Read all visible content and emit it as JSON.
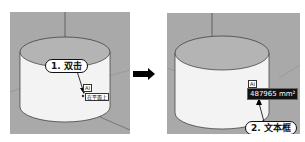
{
  "left_panel": {
    "callout": "1. 双击",
    "tag_top": "AI",
    "tag_bottom": "在平面上"
  },
  "right_panel": {
    "callout": "2. 文本框",
    "tag_top": "AI",
    "text_box_value": "487965 mm²"
  },
  "arrow": "right-arrow-icon"
}
